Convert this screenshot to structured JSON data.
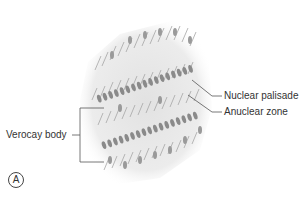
{
  "figure": {
    "panel_letter": "A",
    "labels": {
      "nuclear_palisade": "Nuclear palisade",
      "anuclear_zone": "Anuclear zone",
      "verocay_body": "Verocay body"
    },
    "colors": {
      "tissue_bg": "#e4e4e4",
      "nuclei": "#8a8a8a",
      "fibers": "#a8a8a8",
      "leader_lines": "#555555",
      "text": "#333333"
    }
  }
}
